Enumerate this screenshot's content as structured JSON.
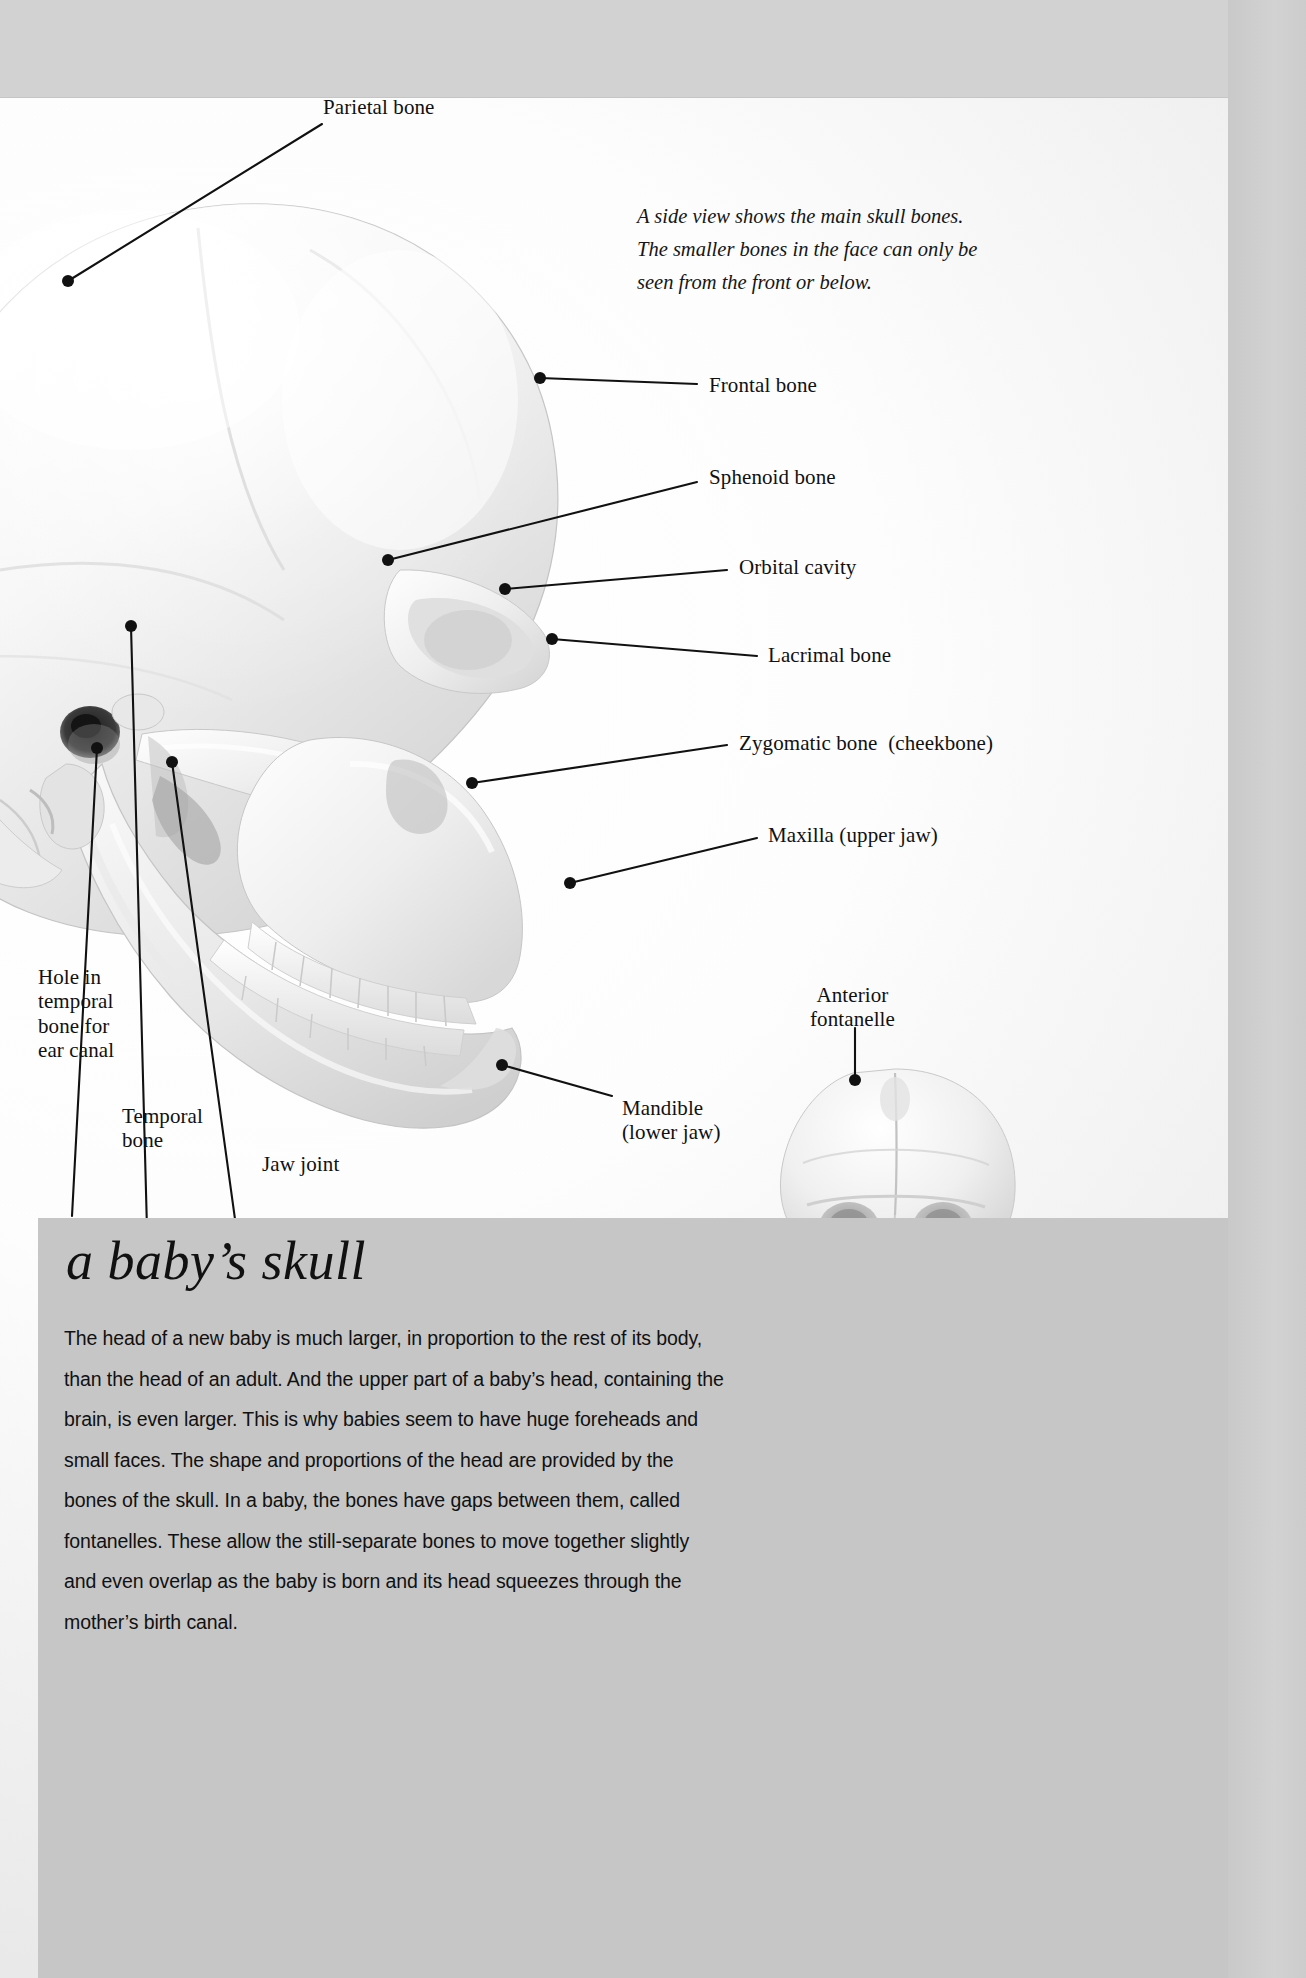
{
  "page": {
    "background_color": "#d0d0d0",
    "paper_color": "#ffffff",
    "panel_color": "#c6c6c6",
    "ink_color": "#111111"
  },
  "caption": {
    "line1": "A side view shows the main skull bones.",
    "line2": "The smaller bones in the face can only be",
    "line3": "seen from the front or below."
  },
  "labels": {
    "parietal_bone": "Parietal bone",
    "frontal_bone": "Frontal bone",
    "sphenoid_bone": "Sphenoid bone",
    "orbital_cavity": "Orbital cavity",
    "lacrimal_bone": "Lacrimal bone",
    "zygomatic_bone": "Zygomatic bone  (cheekbone)",
    "maxilla": "Maxilla (upper jaw)",
    "mandible": "Mandible\n(lower jaw)",
    "hole_in_temporal_bone": "Hole in\ntemporal\nbone for\near canal",
    "temporal_bone": "Temporal\nbone",
    "jaw_joint": "Jaw joint",
    "anterior_fontanelle": "Anterior\nfontanelle"
  },
  "panel": {
    "title": "a baby’s skull",
    "body": "The head of a new baby is much larger, in proportion to the rest of its body, than the head of an adult. And the upper part of a baby’s head, containing the brain, is even larger. This is why babies seem to have huge foreheads and small faces. The shape and proportions of the head are provided by the bones of the skull. In a baby, the bones have gaps between them, called fontanelles. These allow the still-separate bones to move together slightly and even overlap as the baby is born and its head squeezes through the mother’s birth canal."
  },
  "figures": {
    "adult_skull_side": "adult-skull-lateral-photograph",
    "baby_skull_front": "baby-skull-frontal-photograph",
    "baby_skull_side": "baby-skull-lateral-photograph"
  }
}
